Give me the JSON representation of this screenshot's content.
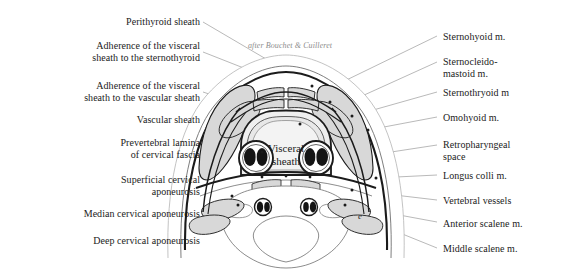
{
  "figure": {
    "attribution": "after Bouchet & Cuilleret",
    "center_label": "Visceral\nsheath",
    "marker_letter": "e",
    "colors": {
      "ink": "#1b1b1b",
      "leader_line": "#8a8a8a",
      "muscle_fill": "#d8d8d8",
      "sheath_fill": "#ececec",
      "vessel_dark": "#141414",
      "background": "#ffffff",
      "attribution_text": "#8d8d8d"
    }
  },
  "labels_left": [
    {
      "text": "Perithyroid sheath"
    },
    {
      "text": "Adherence of the visceral\nsheath to the sternothyroid"
    },
    {
      "text": "Adherence of the visceral\nsheath to the vascular sheath"
    },
    {
      "text": "Vascular sheath"
    },
    {
      "text": "Prevertebral lamina\nof cervical fascia"
    },
    {
      "text": "Superficial cervical\naponeurosis"
    },
    {
      "text": "Median cervical aponeurosis"
    },
    {
      "text": "Deep cervical aponeurosis"
    }
  ],
  "labels_right": [
    {
      "text": "Sternohyoid m."
    },
    {
      "text": "Sternocleido-\nmastoid m."
    },
    {
      "text": "Sternothryoid m"
    },
    {
      "text": "Omohyoid m."
    },
    {
      "text": "Retropharyngeal\nspace"
    },
    {
      "text": "Longus colli m."
    },
    {
      "text": "Vertebral vessels"
    },
    {
      "text": "Anterior scalene m."
    },
    {
      "text": "Middle scalene m."
    }
  ]
}
